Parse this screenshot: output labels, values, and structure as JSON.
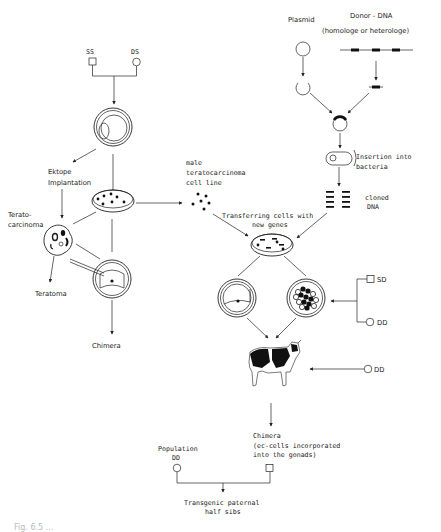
{
  "diagram": {
    "left_branch": {
      "parents": {
        "sire": "SS",
        "dam": "DS"
      },
      "ektope_implantation": [
        "Ektope",
        "Implantation"
      ],
      "teratocarcinoma": [
        "Terato-",
        "carcinoma"
      ],
      "teratoma": "Teratoma",
      "chimera": "Chimera"
    },
    "male_line": [
      "male",
      "teratocarcinoma",
      "cell line"
    ],
    "right_branch": {
      "plasmid": "Plasmid",
      "donor_dna": "Donor - DNA",
      "donor_dna_type": "(homologe or heterologe)",
      "insertion": [
        "Insertion into",
        "bacteria"
      ],
      "cloned_dna": [
        "cloned",
        "DNA"
      ],
      "transferring": [
        "Transferring cells with",
        "new genes"
      ],
      "embryo_parents": {
        "sire": "SD",
        "dam": "DD"
      },
      "recipient": "DD"
    },
    "bottom": {
      "chimera": [
        "Chimera",
        "(ec-cells incorporated",
        "into the gonads)"
      ],
      "population": [
        "Population",
        "DD"
      ],
      "result": [
        "Transgenic paternal",
        "half sibs"
      ]
    },
    "caption": "Fig. 6.5 ..."
  }
}
